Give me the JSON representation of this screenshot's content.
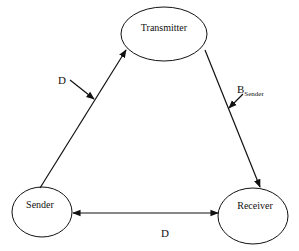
{
  "diagram": {
    "type": "state-triangle",
    "colors": {
      "stroke": "#111111",
      "background": "#ffffff",
      "text": "#111111"
    },
    "nodes": [
      {
        "id": "transmitter",
        "label": "Transmitter"
      },
      {
        "id": "sender",
        "label": "Sender"
      },
      {
        "id": "receiver",
        "label": "Receiver"
      }
    ],
    "edges": [
      {
        "id": "sender-to-transmitter",
        "from": "Sender",
        "to": "Transmitter",
        "label": "D",
        "direction": "forward"
      },
      {
        "id": "transmitter-to-receiver",
        "from": "Transmitter",
        "to": "Receiver",
        "label_main": "B",
        "label_sub": "Sender",
        "direction": "forward"
      },
      {
        "id": "sender-receiver",
        "from": "Sender",
        "to": "Receiver",
        "label": "D",
        "direction": "bidirectional"
      }
    ]
  }
}
